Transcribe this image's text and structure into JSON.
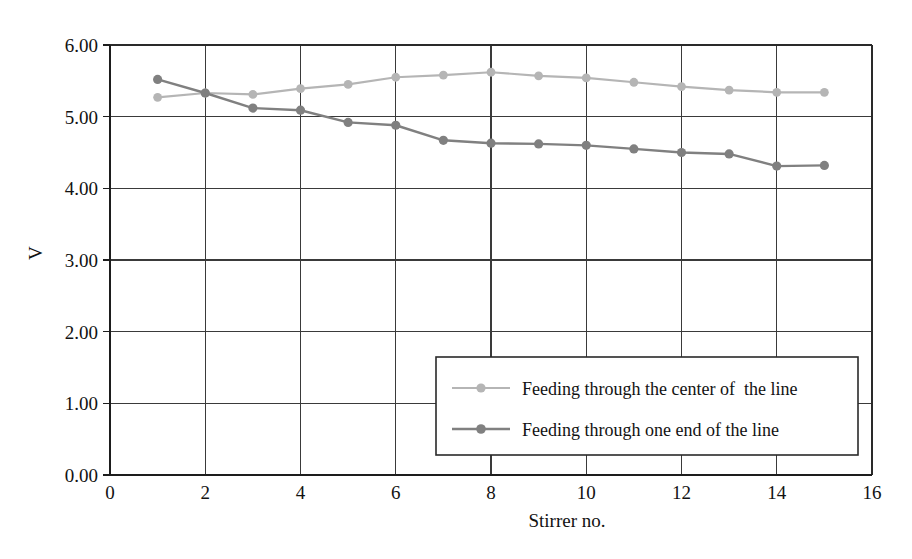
{
  "chart_data": {
    "type": "line",
    "title": "",
    "xlabel": "Stirrer no.",
    "ylabel": "V",
    "xlim": [
      0,
      16
    ],
    "ylim": [
      0,
      6
    ],
    "grid": true,
    "legend_position": "inside-bottom-right",
    "x_ticks": [
      "0",
      "2",
      "4",
      "6",
      "8",
      "10",
      "12",
      "14",
      "16"
    ],
    "x_tick_values": [
      0,
      2,
      4,
      6,
      8,
      10,
      12,
      14,
      16
    ],
    "y_ticks": [
      "0.00",
      "1.00",
      "2.00",
      "3.00",
      "4.00",
      "5.00",
      "6.00"
    ],
    "y_tick_values": [
      0,
      1,
      2,
      3,
      4,
      5,
      6
    ],
    "x": [
      1,
      2,
      3,
      4,
      5,
      6,
      7,
      8,
      9,
      10,
      11,
      12,
      13,
      14,
      15
    ],
    "series": [
      {
        "name": "Feeding through the center of  the line",
        "color": "#b5b5b5",
        "marker": "circle",
        "values": [
          5.27,
          5.33,
          5.31,
          5.39,
          5.45,
          5.55,
          5.58,
          5.62,
          5.57,
          5.54,
          5.48,
          5.42,
          5.37,
          5.34,
          5.34
        ]
      },
      {
        "name": "Feeding through one end of the line",
        "color": "#808080",
        "marker": "circle",
        "values": [
          5.52,
          5.33,
          5.12,
          5.09,
          4.92,
          4.88,
          4.67,
          4.63,
          4.62,
          4.6,
          4.55,
          4.5,
          4.48,
          4.31,
          4.32
        ]
      }
    ]
  },
  "legend": {
    "entries": [
      {
        "label": "Feeding through the center of  the line"
      },
      {
        "label": "Feeding through one end of the line"
      }
    ]
  },
  "axes": {
    "x_title": "Stirrer no.",
    "y_title": "V"
  },
  "colors": {
    "series_center": "#b5b5b5",
    "series_one_end": "#808080",
    "grid": "#3a3a3a",
    "axis": "#1d1d1d",
    "text": "#121212",
    "background": "#ffffff"
  }
}
